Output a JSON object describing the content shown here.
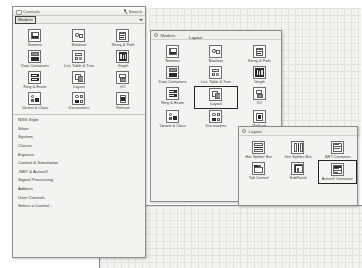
{
  "window": {
    "title": "Controls",
    "search_label": "Search",
    "grip_icon": "drag-grip-icon",
    "search_icon": "magnifier-icon"
  },
  "breadcrumb": {
    "current": "Modern",
    "caret_icon": "chevron-down-icon"
  },
  "palette_modern": {
    "items": [
      {
        "label": "Numeric",
        "icon": "numeric-control-icon"
      },
      {
        "label": "Boolean",
        "icon": "boolean-control-icon"
      },
      {
        "label": "String & Path",
        "icon": "string-path-icon"
      },
      {
        "label": "Data Containers",
        "icon": "data-containers-icon"
      },
      {
        "label": "List, Table & Tree",
        "icon": "list-table-tree-icon"
      },
      {
        "label": "Graph",
        "icon": "graph-icon"
      },
      {
        "label": "Ring & Enum",
        "icon": "ring-enum-icon"
      },
      {
        "label": "Layout",
        "icon": "layout-icon"
      },
      {
        "label": "I/O",
        "icon": "io-icon"
      },
      {
        "label": "Variant & Class",
        "icon": "variant-class-icon"
      },
      {
        "label": "Decorations",
        "icon": "decorations-icon"
      },
      {
        "label": "Refnum",
        "icon": "refnum-icon"
      }
    ]
  },
  "categories": [
    "NXG Style",
    "Silver",
    "System",
    "Classic",
    "Express",
    "Control & Simulation",
    ".NET & ActiveX",
    "Signal Processing",
    "Addons",
    "User Controls",
    "Select a Control..."
  ],
  "palette_modern_2": {
    "header": "Modern",
    "back_icon": "back-arrow-icon",
    "tooltip": "Layout",
    "selected_label": "Layout",
    "items": [
      {
        "label": "Numeric",
        "icon": "numeric-control-icon",
        "selected": false
      },
      {
        "label": "Boolean",
        "icon": "boolean-control-icon",
        "selected": false
      },
      {
        "label": "String & Path",
        "icon": "string-path-icon",
        "selected": false
      },
      {
        "label": "Data Containers",
        "icon": "data-containers-icon",
        "selected": false
      },
      {
        "label": "List, Table & Tree",
        "icon": "list-table-tree-icon",
        "selected": false
      },
      {
        "label": "Graph",
        "icon": "graph-icon",
        "selected": false
      },
      {
        "label": "Ring & Enum",
        "icon": "ring-enum-icon",
        "selected": false
      },
      {
        "label": "Layout",
        "icon": "layout-icon",
        "selected": true
      },
      {
        "label": "I/O",
        "icon": "io-icon",
        "selected": false
      },
      {
        "label": "Variant & Class",
        "icon": "variant-class-icon",
        "selected": false
      },
      {
        "label": "Decorations",
        "icon": "decorations-icon",
        "selected": false
      },
      {
        "label": "Refnum",
        "icon": "refnum-icon",
        "selected": false
      }
    ]
  },
  "palette_layout": {
    "header": "Layout",
    "back_icon": "back-arrow-icon",
    "items": [
      {
        "label": "Hor Splitter Bar",
        "icon": "horizontal-splitter-icon",
        "selected": false
      },
      {
        "label": "Vert Splitter Bar",
        "icon": "vertical-splitter-icon",
        "selected": false
      },
      {
        "label": ".NET Container",
        "icon": "net-container-icon",
        "selected": false
      },
      {
        "label": "Tab Control",
        "icon": "tab-control-icon",
        "selected": false
      },
      {
        "label": "SubPanel",
        "icon": "subpanel-icon",
        "selected": false
      },
      {
        "label": "ActiveX Container",
        "icon": "activex-container-icon",
        "selected": true
      }
    ]
  },
  "colors": {
    "panel_bg": "#f3f3f1",
    "grid_bg": "#f2f2f0",
    "grid_line": "#e2e2de",
    "border": "#8d8d8d",
    "selection": "#262626",
    "text": "#3a3a3a"
  }
}
